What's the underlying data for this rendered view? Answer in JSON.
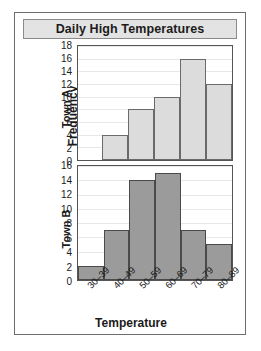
{
  "chart_data": {
    "type": "bar",
    "title": "Daily High Temperatures",
    "xlabel": "Temperature",
    "ylabel": "Frequency",
    "grid": true,
    "legend": "none",
    "categories": [
      "30–39",
      "40–49",
      "50–59",
      "60–69",
      "70–79",
      "80–89"
    ],
    "panels": [
      {
        "name": "Town A",
        "values": [
          0,
          4,
          8,
          10,
          16,
          12
        ],
        "ylim": [
          0,
          18
        ],
        "yticks": [
          0,
          2,
          4,
          6,
          8,
          10,
          12,
          14,
          16,
          18
        ],
        "bar_color": "#dcdcdc"
      },
      {
        "name": "Town B",
        "values": [
          2,
          7,
          14,
          15,
          7,
          5
        ],
        "ylim": [
          0,
          16
        ],
        "yticks": [
          0,
          2,
          4,
          6,
          8,
          10,
          12,
          14,
          16
        ],
        "bar_color": "#9b9b9b"
      }
    ]
  },
  "title": {
    "text": "Daily High Temperatures"
  },
  "axes": {
    "y_label": "Frequency",
    "x_label": "Temperature"
  }
}
